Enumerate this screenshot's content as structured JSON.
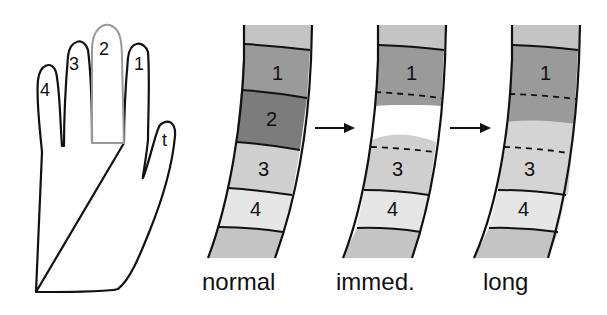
{
  "hand": {
    "fingers": [
      {
        "id": "4",
        "label": "4"
      },
      {
        "id": "3",
        "label": "3"
      },
      {
        "id": "2",
        "label": "2",
        "highlighted": true
      },
      {
        "id": "1",
        "label": "1"
      },
      {
        "id": "t",
        "label": "t"
      }
    ]
  },
  "strips": [
    {
      "caption": "normal",
      "segments": [
        "1",
        "2",
        "3",
        "4"
      ]
    },
    {
      "caption": "immed.",
      "segments": [
        "1",
        "3",
        "4"
      ]
    },
    {
      "caption": "long",
      "segments": [
        "1",
        "3",
        "4"
      ]
    }
  ],
  "colors": {
    "outline": "#111111",
    "highlight_finger": "#999999",
    "edge_band": "#c4c4c4",
    "seg1": "#9a9a9a",
    "seg2": "#7c7c7c",
    "seg3": "#cfcfcf",
    "seg4": "#e6e6e6",
    "gap": "#ffffff",
    "long_spread": "#d4d4d4"
  }
}
